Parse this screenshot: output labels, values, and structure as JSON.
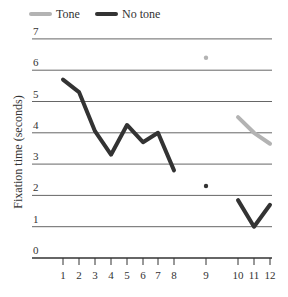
{
  "chart_data": {
    "type": "line",
    "title": "",
    "xlabel": "",
    "ylabel": "Fixation time (seconds)",
    "ylim": [
      0,
      7
    ],
    "yticks": [
      0,
      1,
      2,
      3,
      4,
      5,
      6,
      7
    ],
    "xticks": [
      1,
      2,
      3,
      4,
      5,
      6,
      7,
      8,
      9,
      10,
      11,
      12
    ],
    "grid": true,
    "legend_position": "top-left",
    "series": [
      {
        "name": "Tone",
        "color": "#b3b3b3",
        "points": [
          {
            "x": 9,
            "y": 6.4,
            "style": "dot"
          },
          {
            "x": 10,
            "y": 4.5
          },
          {
            "x": 11,
            "y": 4.0
          },
          {
            "x": 12,
            "y": 3.65
          }
        ]
      },
      {
        "name": "No tone",
        "color": "#333333",
        "points": [
          {
            "x": 1,
            "y": 5.7
          },
          {
            "x": 2,
            "y": 5.3
          },
          {
            "x": 3,
            "y": 4.05
          },
          {
            "x": 4,
            "y": 3.3
          },
          {
            "x": 5,
            "y": 4.25
          },
          {
            "x": 6,
            "y": 3.7
          },
          {
            "x": 7,
            "y": 4.0
          },
          {
            "x": 8,
            "y": 2.8
          },
          {
            "x": 9,
            "y": 2.3,
            "style": "dot"
          },
          {
            "x": 10,
            "y": 1.85
          },
          {
            "x": 11,
            "y": 1.0
          },
          {
            "x": 12,
            "y": 1.7
          }
        ]
      }
    ]
  },
  "legend": {
    "items": [
      {
        "label": "Tone",
        "color": "#b3b3b3"
      },
      {
        "label": "No tone",
        "color": "#333333"
      }
    ]
  },
  "axis": {
    "y_title": "Fixation time (seconds)",
    "y_labels": [
      "0",
      "1",
      "2",
      "3",
      "4",
      "5",
      "6",
      "7"
    ],
    "x_labels": [
      "1",
      "2",
      "3",
      "4",
      "5",
      "6",
      "7",
      "8",
      "9",
      "10",
      "11",
      "12"
    ]
  }
}
